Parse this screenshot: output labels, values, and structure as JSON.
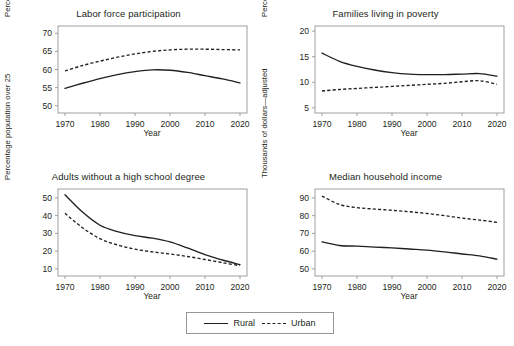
{
  "figure": {
    "width": 514,
    "height": 346,
    "background": "#ffffff",
    "line_color": "#231f20",
    "axis_color": "#939598"
  },
  "legend": {
    "name": "series-legend",
    "position": "bottom-center",
    "items": [
      {
        "label": "Rural",
        "style": "solid"
      },
      {
        "label": "Urban",
        "style": "dashed"
      }
    ]
  },
  "chart_data": [
    {
      "type": "line",
      "title": "Labor force participation",
      "xlabel": "Year",
      "ylabel": "Percentage population over 16",
      "xlim": [
        1968,
        2022
      ],
      "ylim": [
        48,
        72
      ],
      "xticks": [
        1970,
        1980,
        1990,
        2000,
        2010,
        2020
      ],
      "yticks": [
        50,
        55,
        60,
        65,
        70
      ],
      "grid": false,
      "x": [
        1970,
        1975,
        1980,
        1985,
        1990,
        1995,
        2000,
        2005,
        2010,
        2015,
        2020
      ],
      "series": [
        {
          "name": "Rural",
          "style": "solid",
          "values": [
            54.8,
            56.2,
            57.5,
            58.6,
            59.4,
            59.9,
            59.8,
            59.2,
            58.3,
            57.4,
            56.3
          ]
        },
        {
          "name": "Urban",
          "style": "dashed",
          "values": [
            59.6,
            61.1,
            62.3,
            63.4,
            64.3,
            65.0,
            65.4,
            65.6,
            65.6,
            65.5,
            65.4
          ]
        }
      ]
    },
    {
      "type": "line",
      "title": "Families living in poverty",
      "xlabel": "Year",
      "ylabel": "Percentage families",
      "xlim": [
        1968,
        2022
      ],
      "ylim": [
        4,
        21
      ],
      "xticks": [
        1970,
        1980,
        1990,
        2000,
        2010,
        2020
      ],
      "yticks": [
        5,
        10,
        15,
        20
      ],
      "grid": false,
      "x": [
        1970,
        1975,
        1980,
        1985,
        1990,
        1995,
        2000,
        2005,
        2010,
        2015,
        2020
      ],
      "series": [
        {
          "name": "Rural",
          "style": "solid",
          "values": [
            15.7,
            14.1,
            13.1,
            12.4,
            11.9,
            11.6,
            11.5,
            11.5,
            11.6,
            11.7,
            11.2
          ]
        },
        {
          "name": "Urban",
          "style": "dashed",
          "values": [
            8.3,
            8.6,
            8.8,
            9.0,
            9.2,
            9.4,
            9.6,
            9.8,
            10.1,
            10.3,
            9.6
          ]
        }
      ]
    },
    {
      "type": "line",
      "title": "Adults without a high school degree",
      "xlabel": "Year",
      "ylabel": "Percentage population over 25",
      "xlim": [
        1968,
        2022
      ],
      "ylim": [
        6,
        55
      ],
      "xticks": [
        1970,
        1980,
        1990,
        2000,
        2010,
        2020
      ],
      "yticks": [
        10,
        20,
        30,
        40,
        50
      ],
      "grid": false,
      "x": [
        1970,
        1975,
        1980,
        1985,
        1990,
        1995,
        2000,
        2005,
        2010,
        2015,
        2020
      ],
      "series": [
        {
          "name": "Rural",
          "style": "solid",
          "values": [
            51.8,
            42.0,
            34.6,
            31.0,
            28.7,
            27.3,
            25.2,
            21.8,
            18.0,
            15.0,
            12.4
          ]
        },
        {
          "name": "Urban",
          "style": "dashed",
          "values": [
            41.3,
            33.2,
            27.0,
            23.5,
            21.1,
            19.6,
            18.4,
            17.0,
            15.3,
            13.5,
            11.8
          ]
        }
      ]
    },
    {
      "type": "line",
      "title": "Median household income",
      "xlabel": "Year",
      "ylabel": "Thousands of dollars—adjusted",
      "xlim": [
        1968,
        2022
      ],
      "ylim": [
        46,
        95
      ],
      "xticks": [
        1970,
        1980,
        1990,
        2000,
        2010,
        2020
      ],
      "yticks": [
        50,
        60,
        70,
        80,
        90
      ],
      "grid": false,
      "x": [
        1970,
        1975,
        1980,
        1985,
        1990,
        1995,
        2000,
        2005,
        2010,
        2015,
        2020
      ],
      "series": [
        {
          "name": "Rural",
          "style": "solid",
          "values": [
            65.2,
            63.2,
            62.8,
            62.3,
            61.8,
            61.2,
            60.6,
            59.6,
            58.4,
            57.3,
            55.5
          ]
        },
        {
          "name": "Urban",
          "style": "dashed",
          "values": [
            91.0,
            86.3,
            84.5,
            83.7,
            83.0,
            82.2,
            81.2,
            80.0,
            78.6,
            77.5,
            76.2
          ]
        }
      ]
    }
  ]
}
